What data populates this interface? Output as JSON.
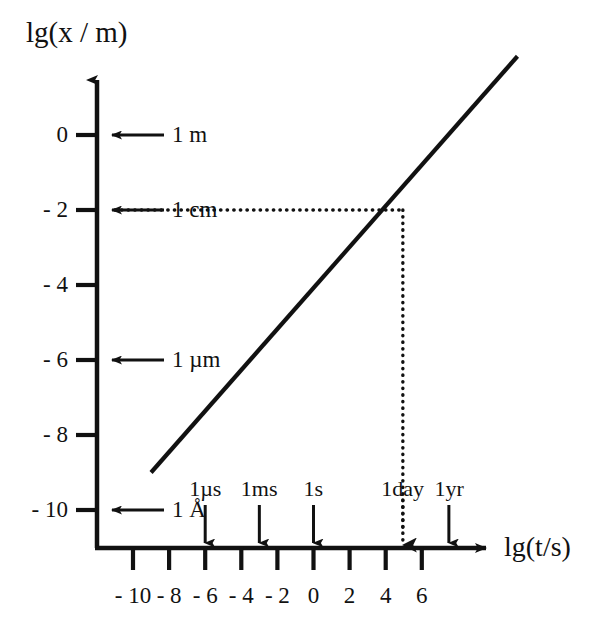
{
  "chart_data": {
    "type": "line",
    "title": "",
    "xlabel": "lg(t/s)",
    "ylabel": "lg(x / m)",
    "xlim": [
      -11.6,
      8.6
    ],
    "ylim": [
      -11.0,
      1.7
    ],
    "grid": false,
    "legend": null,
    "x_ticks": [
      -10,
      -8,
      -6,
      -4,
      -2,
      0,
      2,
      4,
      6
    ],
    "x_tick_labels": [
      "- 10",
      "- 8",
      "- 6",
      "- 4",
      "- 2",
      "0",
      "2",
      "4",
      "6"
    ],
    "y_ticks": [
      0,
      -2,
      -4,
      -6,
      -8,
      -10
    ],
    "y_tick_labels": [
      "0",
      "- 2",
      "- 4",
      "- 6",
      "- 8",
      "- 10"
    ],
    "series": [
      {
        "name": "diffusion-length-line",
        "style": "solid",
        "x": [
          -9.0,
          11.3
        ],
        "y": [
          -9.0,
          2.1
        ]
      }
    ],
    "y_annotations": [
      {
        "label": "1 m",
        "value": 0,
        "marker": "left-arrow"
      },
      {
        "label": "1 cm",
        "value": -2,
        "marker": "left-arrow"
      },
      {
        "label": "1 µm",
        "value": -6,
        "marker": "left-arrow"
      },
      {
        "label": "1 Å",
        "value": -10,
        "marker": "left-arrow"
      }
    ],
    "x_annotations": [
      {
        "label": "1µs",
        "value": -6,
        "marker": "down-arrow",
        "style": "solid"
      },
      {
        "label": "1ms",
        "value": -3,
        "marker": "down-arrow",
        "style": "solid"
      },
      {
        "label": "1s",
        "value": 0,
        "marker": "down-arrow",
        "style": "solid"
      },
      {
        "label": "1day",
        "value": 4.95,
        "marker": "down-arrow",
        "style": "dotted"
      },
      {
        "label": "1yr",
        "value": 7.5,
        "marker": "down-arrow",
        "style": "solid"
      }
    ],
    "guide_lines": [
      {
        "name": "horizontal-guide",
        "style": "dotted",
        "from": {
          "x": -11.0,
          "y": -2
        },
        "to": {
          "x": 4.95,
          "y": -2
        }
      },
      {
        "name": "vertical-guide",
        "style": "dotted",
        "from": {
          "x": 4.95,
          "y": -2
        },
        "to": {
          "x": 4.95,
          "y": -10.6
        }
      }
    ],
    "intersection_point": {
      "x": 4.95,
      "y": -2
    },
    "colors": {
      "ink": "#111111",
      "background": "#ffffff"
    }
  }
}
